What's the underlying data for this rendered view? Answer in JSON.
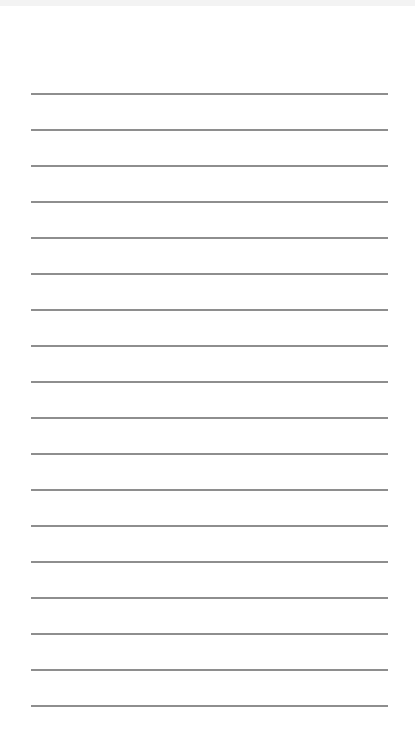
{
  "page": {
    "type": "lined-paper",
    "background_color": "#ffffff",
    "line_color": "#7a7a7a",
    "line_count": 18,
    "line_left": 31,
    "line_width": 357,
    "first_line_y": 93,
    "line_spacing": 36
  }
}
